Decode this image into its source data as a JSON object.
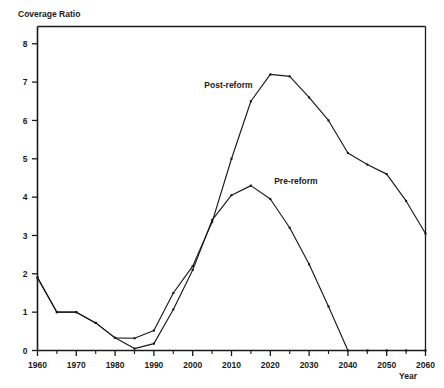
{
  "chart_data": {
    "type": "line",
    "title": "",
    "ylabel": "Coverage Ratio",
    "xlabel": "Year",
    "xlim": [
      1960,
      2060
    ],
    "ylim": [
      0,
      8.45
    ],
    "grid": false,
    "legend_position": "inline-annotations",
    "x_ticks_major": [
      1960,
      1970,
      1980,
      1990,
      2000,
      2010,
      2020,
      2030,
      2040,
      2050,
      2060
    ],
    "x_ticks_minor": [
      1965,
      1975,
      1985,
      1995,
      2005,
      2015,
      2025,
      2035,
      2045,
      2055
    ],
    "y_ticks_major": [
      0,
      1,
      2,
      3,
      4,
      5,
      6,
      7,
      8
    ],
    "x_tick_labels": [
      "1960",
      "1970",
      "1980",
      "1990",
      "2000",
      "2010",
      "2020",
      "2030",
      "2040",
      "2050",
      "2060"
    ],
    "y_tick_labels": [
      "0",
      "1",
      "2",
      "3",
      "4",
      "5",
      "6",
      "7",
      "8"
    ],
    "series": [
      {
        "name": "Post-reform",
        "label": "Post-reform",
        "label_x": 2003,
        "label_y": 6.85,
        "x": [
          1960,
          1965,
          1970,
          1975,
          1980,
          1985,
          1990,
          1995,
          2000,
          2005,
          2010,
          2015,
          2020,
          2025,
          2030,
          2035,
          2040,
          2045,
          2050,
          2055,
          2060
        ],
        "values": [
          1.9,
          1.0,
          1.0,
          0.72,
          0.33,
          0.32,
          0.52,
          1.5,
          2.2,
          3.35,
          5.0,
          6.5,
          7.2,
          7.15,
          6.6,
          6.0,
          5.15,
          4.85,
          4.6,
          3.9,
          3.05
        ]
      },
      {
        "name": "Pre-reform",
        "label": "Pre-reform",
        "label_x": 2021,
        "label_y": 4.35,
        "x": [
          1960,
          1965,
          1970,
          1975,
          1980,
          1985,
          1990,
          1995,
          2000,
          2005,
          2010,
          2015,
          2020,
          2025,
          2030,
          2035,
          2040,
          2045,
          2050,
          2055,
          2060
        ],
        "values": [
          1.9,
          1.0,
          1.0,
          0.72,
          0.33,
          0.05,
          0.18,
          1.07,
          2.1,
          3.4,
          4.05,
          4.3,
          3.95,
          3.2,
          2.25,
          1.15,
          0.0,
          0.0,
          0.0,
          0.0,
          0.0
        ]
      }
    ],
    "annotations": [
      {
        "text": "Post-reform",
        "x": 2003,
        "y": 6.85
      },
      {
        "text": "Pre-reform",
        "x": 2021,
        "y": 4.35
      }
    ]
  }
}
